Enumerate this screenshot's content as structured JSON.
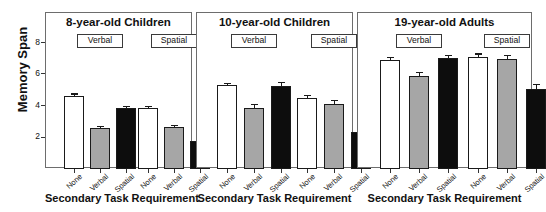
{
  "chart_data": {
    "type": "bar",
    "title": "",
    "ylabel": "Memory Span",
    "xlabel": "Secondary Task Requirement",
    "ylim": [
      0,
      9
    ],
    "yticks": [
      2,
      4,
      6,
      8
    ],
    "ytick_labels": [
      "2",
      "4",
      "6",
      "8"
    ],
    "grid": false,
    "legend": "none",
    "categories": [
      "None",
      "Verbal",
      "Spatial"
    ],
    "group_labels": [
      "Verbal",
      "Spatial"
    ],
    "series": [
      {
        "name": "None",
        "color": "#ffffff"
      },
      {
        "name": "Verbal",
        "color": "#a6a6a6"
      },
      {
        "name": "Spatial",
        "color": "#0d0d0d"
      }
    ],
    "panels": [
      {
        "title": "8-year-old Children",
        "groups": [
          {
            "label": "Verbal",
            "bars": [
              {
                "category": "None",
                "value": 4.65,
                "error": 0.15
              },
              {
                "category": "Verbal",
                "value": 2.6,
                "error": 0.12
              },
              {
                "category": "Spatial",
                "value": 3.85,
                "error": 0.18
              }
            ]
          },
          {
            "label": "Spatial",
            "bars": [
              {
                "category": "None",
                "value": 3.9,
                "error": 0.13
              },
              {
                "category": "Verbal",
                "value": 2.65,
                "error": 0.15
              },
              {
                "category": "Spatial",
                "value": 1.8,
                "error": 0.2
              }
            ]
          }
        ]
      },
      {
        "title": "10-year-old Children",
        "groups": [
          {
            "label": "Verbal",
            "bars": [
              {
                "category": "None",
                "value": 5.35,
                "error": 0.13
              },
              {
                "category": "Verbal",
                "value": 3.9,
                "error": 0.22
              },
              {
                "category": "Spatial",
                "value": 5.25,
                "error": 0.25
              }
            ]
          },
          {
            "label": "Spatial",
            "bars": [
              {
                "category": "None",
                "value": 4.5,
                "error": 0.2
              },
              {
                "category": "Verbal",
                "value": 4.1,
                "error": 0.28
              },
              {
                "category": "Spatial",
                "value": 2.35,
                "error": 0.22
              }
            ]
          }
        ]
      },
      {
        "title": "19-year-old Adults",
        "groups": [
          {
            "label": "Verbal",
            "bars": [
              {
                "category": "None",
                "value": 6.9,
                "error": 0.22
              },
              {
                "category": "Verbal",
                "value": 5.9,
                "error": 0.25
              },
              {
                "category": "Spatial",
                "value": 7.0,
                "error": 0.2
              }
            ]
          },
          {
            "label": "Spatial",
            "bars": [
              {
                "category": "None",
                "value": 7.1,
                "error": 0.22
              },
              {
                "category": "Verbal",
                "value": 6.95,
                "error": 0.28
              },
              {
                "category": "Spatial",
                "value": 5.05,
                "error": 0.35
              }
            ]
          }
        ]
      }
    ]
  },
  "axis": {
    "y_title": "Memory Span",
    "x_title": "Secondary Task Requirement",
    "tick_2": "2",
    "tick_4": "4",
    "tick_6": "6",
    "tick_8": "8"
  }
}
